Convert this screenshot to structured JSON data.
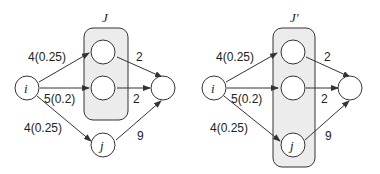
{
  "left_graph": {
    "group_label": "J",
    "source_label": "i",
    "j_label": "j",
    "edges": {
      "i_top": "4(0.25)",
      "i_mid": "5(0.2)",
      "i_j": "4(0.25)",
      "top_sink": "2",
      "mid_sink": "2",
      "j_sink": "9"
    }
  },
  "right_graph": {
    "group_label": "J′",
    "source_label": "i",
    "j_label": "j",
    "edges": {
      "i_top": "4(0.25)",
      "i_mid": "5(0.2)",
      "i_j": "4(0.25)",
      "top_sink": "2",
      "mid_sink": "2",
      "j_sink": "9"
    }
  },
  "colors": {
    "group_fill": "#ececec",
    "stroke": "#333333"
  }
}
